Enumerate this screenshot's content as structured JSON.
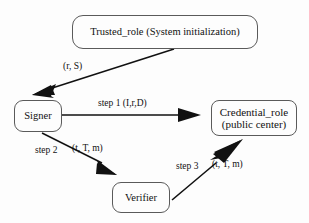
{
  "diagram": {
    "background_color": "#fdfdfd",
    "stroke_color": "#111111",
    "node_border_color": "#5a5a5a",
    "nodes": [
      {
        "id": "trusted",
        "label": "Trusted_role (System initialization)"
      },
      {
        "id": "signer",
        "label": "Signer"
      },
      {
        "id": "credential",
        "label_line1": "Credential_role",
        "label_line2": "(public center)"
      },
      {
        "id": "verifier",
        "label": "Verifier"
      }
    ],
    "edges": [
      {
        "id": "trusted-to-signer",
        "from": "trusted",
        "to": "signer",
        "label": "(r, S)"
      },
      {
        "id": "signer-to-credential",
        "from": "signer",
        "to": "credential",
        "label_step": "step 1",
        "label_payload": "(I,r,D)",
        "label_full": "step 1 (I,r,D)"
      },
      {
        "id": "signer-to-verifier",
        "from": "signer",
        "to": "verifier",
        "label_step": "step 2",
        "label_payload": "(t, T, m)",
        "label_full": "step 2 (t, T, m)"
      },
      {
        "id": "verifier-to-credential",
        "from": "verifier",
        "to": "credential",
        "label_step": "step 3",
        "label_payload": "(t, T, m)",
        "label_full": "step 3 (t, T, m)"
      }
    ]
  }
}
